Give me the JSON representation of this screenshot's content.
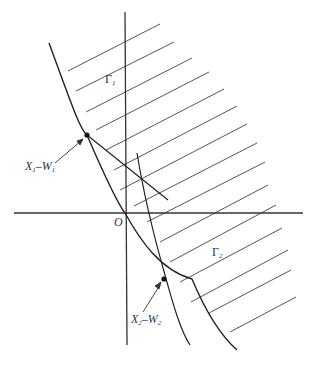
{
  "diagram": {
    "origin_label": "O",
    "regions": [
      {
        "id": "gamma1",
        "label": "Γ",
        "subscript": "1"
      },
      {
        "id": "gamma2",
        "label": "Γ",
        "subscript": "2"
      }
    ],
    "points": [
      {
        "id": "p1",
        "label_a": "X",
        "sub_a": "1",
        "sep": "–",
        "label_b": "W",
        "sub_b": "1"
      },
      {
        "id": "p2",
        "label_a": "X",
        "sub_a": "2",
        "sep": "–",
        "label_b": "W",
        "sub_b": "2"
      }
    ],
    "colors": {
      "axes": "#333333",
      "curve": "#222222",
      "hatch": "#555555",
      "background": "#ffffff"
    }
  }
}
